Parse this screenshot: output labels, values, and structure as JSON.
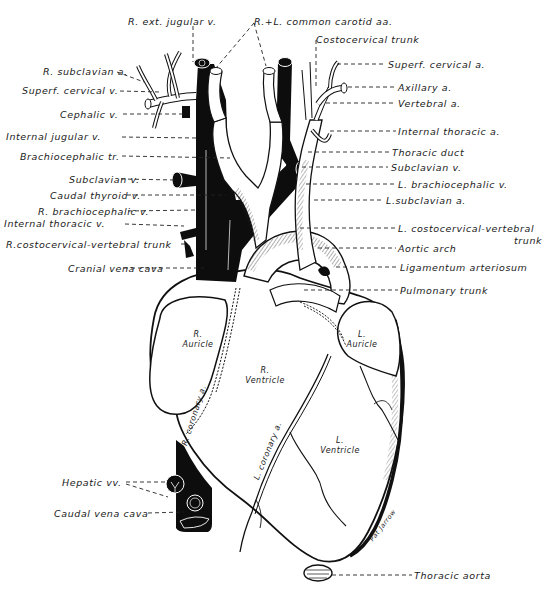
{
  "diagram": {
    "type": "anatomical-illustration",
    "colors": {
      "ink": "#111111",
      "paper": "#ffffff",
      "vein_fill": "#0d0d0d"
    },
    "labels_left": [
      {
        "id": "r-subclavian-a",
        "text": "R. subclavian a."
      },
      {
        "id": "superf-cervical-v",
        "text": "Superf. cervical v."
      },
      {
        "id": "cephalic-v",
        "text": "Cephalic v."
      },
      {
        "id": "internal-jugular-v",
        "text": "Internal jugular v."
      },
      {
        "id": "brachiocephalic-tr",
        "text": "Brachiocephalic tr."
      },
      {
        "id": "subclavian-v-left",
        "text": "Subclavian v."
      },
      {
        "id": "caudal-thyroid-v",
        "text": "Caudal thyroid v."
      },
      {
        "id": "r-brachiocephalic-v",
        "text": "R. brachiocephalic v."
      },
      {
        "id": "internal-thoracic-v",
        "text": "Internal thoracic v."
      },
      {
        "id": "r-costocervical-vertebral-trunk",
        "text": "R.costocervical-vertebral trunk"
      },
      {
        "id": "cranial-vena-cava",
        "text": "Cranial vena cava"
      },
      {
        "id": "hepatic-vv",
        "text": "Hepatic vv."
      },
      {
        "id": "caudal-vena-cava",
        "text": "Caudal vena cava"
      }
    ],
    "labels_top": [
      {
        "id": "r-ext-jugular-v",
        "text": "R. ext. jugular v."
      },
      {
        "id": "r-l-common-carotid-aa",
        "text": "R.+L. common carotid aa."
      },
      {
        "id": "costocervical-trunk",
        "text": "Costocervical trunk"
      }
    ],
    "labels_right": [
      {
        "id": "superf-cervical-a",
        "text": "Superf. cervical a."
      },
      {
        "id": "axillary-a",
        "text": "Axillary a."
      },
      {
        "id": "vertebral-a",
        "text": "Vertebral a."
      },
      {
        "id": "internal-thoracic-a",
        "text": "Internal thoracic a."
      },
      {
        "id": "thoracic-duct",
        "text": "Thoracic duct"
      },
      {
        "id": "subclavian-v-right",
        "text": "Subclavian v."
      },
      {
        "id": "l-brachiocephalic-v",
        "text": "L. brachiocephalic v."
      },
      {
        "id": "l-subclavian-a",
        "text": "L.subclavian a."
      },
      {
        "id": "l-costocervical-vertebral",
        "text": "L. costocervical-vertebral"
      },
      {
        "id": "l-costocervical-trunk-word",
        "text": "trunk"
      },
      {
        "id": "aortic-arch",
        "text": "Aortic arch"
      },
      {
        "id": "ligamentum-arteriosum",
        "text": "Ligamentum arteriosum"
      },
      {
        "id": "pulmonary-trunk",
        "text": "Pulmonary trunk"
      },
      {
        "id": "thoracic-aorta",
        "text": "Thoracic aorta"
      }
    ],
    "labels_inner": {
      "r_auricle": "R.\nAuricle",
      "r_ventricle": "R.\nVentricle",
      "l_auricle": "L.\nAuricle",
      "l_ventricle": "L.\nVentricle",
      "r_coronary_a": "R. coronary a.",
      "l_coronary_a": "L. coronary a.",
      "signature": "Pat Jarrow"
    }
  }
}
